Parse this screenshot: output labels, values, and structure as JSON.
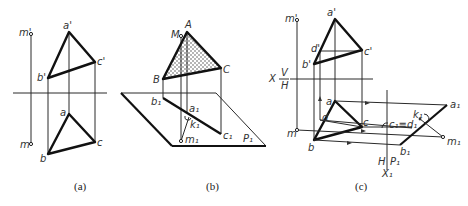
{
  "figures": {
    "a": {
      "caption": "(a)",
      "labels": {
        "m_prime": "m'",
        "a_prime": "a'",
        "b_prime": "b'",
        "c_prime": "c'",
        "a": "a",
        "b": "b",
        "c": "c",
        "m": "m"
      }
    },
    "b": {
      "caption": "(b)",
      "labels": {
        "A": "A",
        "M": "M",
        "B": "B",
        "C": "C",
        "b1": "b₁",
        "a1": "a₁",
        "k1": "k₁",
        "c1": "c₁",
        "m1": "m₁",
        "P1": "P₁"
      }
    },
    "c": {
      "caption": "(c)",
      "labels": {
        "m_prime": "m'",
        "a_prime": "a'",
        "d_prime": "d'",
        "c_prime": "c'",
        "b_prime": "b'",
        "X": "X",
        "V": "V",
        "H": "H",
        "a": "a",
        "d": "d",
        "c": "c",
        "b": "b",
        "m": "m",
        "c1d1": "c₁≡d₁",
        "k1": "k₁",
        "a1": "a₁",
        "m1": "m₁",
        "b1": "b₁",
        "H2": "H",
        "P1": "P₁",
        "X1": "X₁"
      }
    }
  }
}
